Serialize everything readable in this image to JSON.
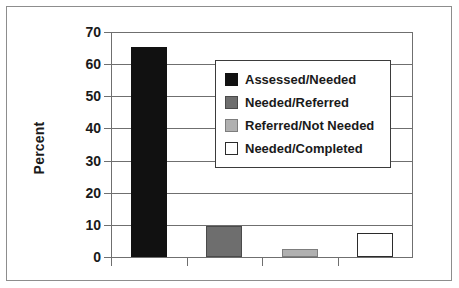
{
  "chart_data": {
    "type": "bar",
    "title": "",
    "xlabel": "",
    "ylabel": "Percent",
    "ylim": [
      0,
      70
    ],
    "ytick_labels": [
      "0",
      "10",
      "20",
      "30",
      "40",
      "50",
      "60",
      "70"
    ],
    "ytick_values": [
      0,
      10,
      20,
      30,
      40,
      50,
      60,
      70
    ],
    "grid": "horizontal",
    "legend_position": "upper-right-inside",
    "categories": [
      "Assessed/Needed",
      "Needed/Referred",
      "Referred/Not Needed",
      "Needed/Completed"
    ],
    "values": [
      65.4,
      9.5,
      2.5,
      7.5
    ],
    "bar_colors": [
      "#111111",
      "#6e6e6e",
      "#b0b0b0",
      "#ffffff"
    ],
    "bar_edge_colors": [
      "#111111",
      "#4a4a4a",
      "#7d7d7d",
      "#2b2b2b"
    ],
    "xtick_labels": [
      "",
      "",
      "",
      ""
    ]
  },
  "legend": {
    "items": [
      {
        "label": "Assessed/Needed",
        "color": "#111111",
        "edge": "#111111"
      },
      {
        "label": "Needed/Referred",
        "color": "#6e6e6e",
        "edge": "#4a4a4a"
      },
      {
        "label": "Referred/Not Needed",
        "color": "#b0b0b0",
        "edge": "#7d7d7d"
      },
      {
        "label": "Needed/Completed",
        "color": "#ffffff",
        "edge": "#2b2b2b"
      }
    ]
  },
  "axis": {
    "y_title": "Percent"
  }
}
